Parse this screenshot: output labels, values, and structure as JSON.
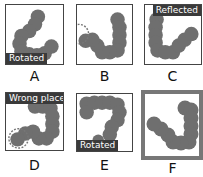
{
  "figure": {
    "bead_color": "#6f6f6f",
    "panels": [
      {
        "id": "A",
        "letter": "A",
        "tag": "Rotated",
        "tag_position": "bottom-left",
        "highlight_circle": false,
        "thick_border": false
      },
      {
        "id": "B",
        "letter": "B",
        "tag": "",
        "highlight_circle": true,
        "thick_border": false
      },
      {
        "id": "C",
        "letter": "C",
        "tag": "Reflected",
        "tag_position": "top-right",
        "highlight_circle": false,
        "thick_border": false
      },
      {
        "id": "D",
        "letter": "D",
        "tag": "Wrong place",
        "tag_position": "top",
        "highlight_circle": true,
        "thick_border": false
      },
      {
        "id": "E",
        "letter": "E",
        "tag": "Rotated",
        "tag_position": "bottom-left",
        "highlight_circle": false,
        "thick_border": false
      },
      {
        "id": "F",
        "letter": "F",
        "tag": "",
        "highlight_circle": false,
        "thick_border": true
      }
    ]
  }
}
